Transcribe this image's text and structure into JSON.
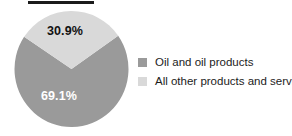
{
  "figure": {
    "background": "#ffffff",
    "title_rule_color": "#1b1b1b"
  },
  "chart_data": {
    "type": "pie",
    "title": "",
    "xlabel": "",
    "ylabel": "",
    "grid": false,
    "legend_position": "right",
    "categories": [
      "Oil and oil products",
      "All other products and services"
    ],
    "values": [
      69.1,
      30.9
    ],
    "value_labels": [
      "69.1%",
      "30.9%"
    ],
    "colors": [
      "#9a9a9a",
      "#d9d9d9"
    ],
    "label_text_colors": [
      "#ffffff",
      "#111111"
    ],
    "start_angle_deg": 55,
    "direction": "clockwise",
    "units": "percent"
  },
  "pie": {
    "slices": [
      {
        "name": "oil-and-oil-products",
        "label": "69.1%",
        "value": 69.1,
        "color": "#9a9a9a",
        "text_color": "#ffffff"
      },
      {
        "name": "all-other-products-and-services",
        "label": "30.9%",
        "value": 30.9,
        "color": "#d9d9d9",
        "text_color": "#111111"
      }
    ]
  },
  "legend": {
    "items": [
      {
        "label": "Oil and oil products",
        "color": "#9a9a9a"
      },
      {
        "label": "All other products and services",
        "color": "#d9d9d9"
      }
    ]
  }
}
